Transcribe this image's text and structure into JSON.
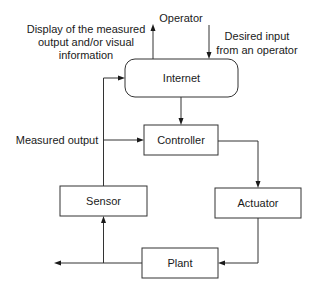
{
  "diagram": {
    "type": "block-diagram",
    "title": "",
    "nodes": {
      "internet": {
        "label": "Internet",
        "shape": "rounded-rectangle"
      },
      "controller": {
        "label": "Controller",
        "shape": "rectangle"
      },
      "sensor": {
        "label": "Sensor",
        "shape": "rectangle"
      },
      "actuator": {
        "label": "Actuator",
        "shape": "rectangle"
      },
      "plant": {
        "label": "Plant",
        "shape": "rectangle"
      }
    },
    "annotations": {
      "operator": "Operator",
      "display_line1": "Display of the measured",
      "display_line2": "output and/or visual",
      "display_line3": "information",
      "desired_line1": "Desired input",
      "desired_line2": "from an operator",
      "measured_output": "Measured output"
    },
    "edges": [
      {
        "from": "internet",
        "to": "operator-display",
        "label": "Display of the measured output and/or visual information"
      },
      {
        "from": "operator",
        "to": "internet",
        "label": "Desired input from an operator"
      },
      {
        "from": "internet",
        "to": "controller"
      },
      {
        "from": "controller",
        "to": "actuator"
      },
      {
        "from": "actuator",
        "to": "plant"
      },
      {
        "from": "plant",
        "to": "sensor"
      },
      {
        "from": "plant",
        "to": "output"
      },
      {
        "from": "sensor",
        "to": "controller",
        "label": "Measured output"
      },
      {
        "from": "sensor",
        "to": "internet",
        "label": "Measured output"
      }
    ],
    "colors": {
      "stroke": "#333333",
      "text": "#1a1a1a",
      "background": "#ffffff"
    }
  }
}
